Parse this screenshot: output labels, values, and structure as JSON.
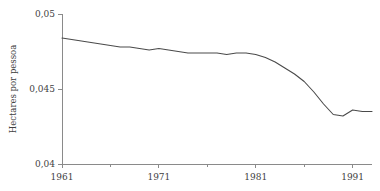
{
  "chart_data": {
    "type": "line",
    "title": "",
    "subtitle": "",
    "xlabel": "",
    "ylabel": "Hectares por pessoa",
    "xlim": [
      1961,
      1993
    ],
    "ylim": [
      0.04,
      0.05
    ],
    "grid": false,
    "legend": null,
    "legend_position": "none",
    "decimal_separator": ",",
    "y_ticks": [
      {
        "value": 0.04,
        "label": "0,04"
      },
      {
        "value": 0.045,
        "label": "0,045"
      },
      {
        "value": 0.05,
        "label": "0,05"
      }
    ],
    "x_ticks": [
      {
        "value": 1961,
        "label": "1961",
        "major": true
      },
      {
        "value": 1966,
        "label": "",
        "major": false
      },
      {
        "value": 1971,
        "label": "1971",
        "major": true
      },
      {
        "value": 1976,
        "label": "",
        "major": false
      },
      {
        "value": 1981,
        "label": "1981",
        "major": true
      },
      {
        "value": 1986,
        "label": "",
        "major": false
      },
      {
        "value": 1991,
        "label": "1991",
        "major": true
      }
    ],
    "series": [
      {
        "name": "Hectares por pessoa",
        "color": "#4a4a4a",
        "x": [
          1961,
          1962,
          1963,
          1964,
          1965,
          1966,
          1967,
          1968,
          1969,
          1970,
          1971,
          1972,
          1973,
          1974,
          1975,
          1976,
          1977,
          1978,
          1979,
          1980,
          1981,
          1982,
          1983,
          1984,
          1985,
          1986,
          1987,
          1988,
          1989,
          1990,
          1991,
          1992,
          1993
        ],
        "values": [
          0.0484,
          0.0483,
          0.0482,
          0.0481,
          0.048,
          0.0479,
          0.0478,
          0.0478,
          0.0477,
          0.0476,
          0.0477,
          0.0476,
          0.0475,
          0.0474,
          0.0474,
          0.0474,
          0.0474,
          0.0473,
          0.0474,
          0.0474,
          0.0473,
          0.0471,
          0.0468,
          0.0464,
          0.046,
          0.0455,
          0.0448,
          0.044,
          0.0433,
          0.0432,
          0.0436,
          0.0435,
          0.0435
        ]
      }
    ],
    "annotations": []
  },
  "plot_geometry": {
    "left": 62,
    "right": 372,
    "top": 14,
    "bottom": 164
  }
}
